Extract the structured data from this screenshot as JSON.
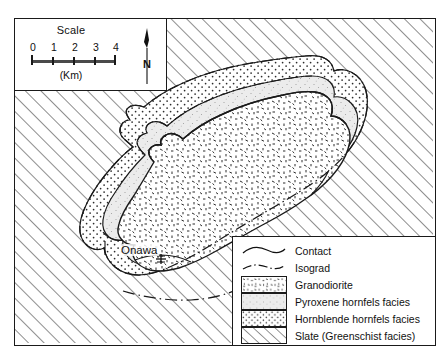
{
  "map": {
    "title": "Onawa pluton contact metamorphic aureole map",
    "place_label": "Onawa",
    "place_marker": "cross-marker"
  },
  "scale": {
    "title": "Scale",
    "ticks": [
      "0",
      "1",
      "2",
      "3",
      "4"
    ],
    "unit": "(Km)",
    "north_label": "N",
    "north_icon": "north-arrow-icon"
  },
  "legend": {
    "rows": [
      {
        "label": "Contact",
        "symbol": "solid-curve-line"
      },
      {
        "label": "Isograd",
        "symbol": "dash-dot-line"
      },
      {
        "label": "Granodiorite",
        "symbol": "coarse-dash-stipple-swatch"
      },
      {
        "label": "Pyroxene hornfels facies",
        "symbol": "fine-stipple-swatch"
      },
      {
        "label": "Hornblende hornfels facies",
        "symbol": "regular-dot-swatch"
      },
      {
        "label": "Slate (Greenschist facies)",
        "symbol": "diagonal-hatch-swatch"
      }
    ]
  },
  "colors": {
    "ink": "#1a1a1a",
    "hatch": "#3a3a3a",
    "granodiorite_fill": "#ffffff",
    "pyroxene_fill": "#ebebeb",
    "hornblende_fill": "#ffffff",
    "slate_fill": "#ffffff"
  }
}
